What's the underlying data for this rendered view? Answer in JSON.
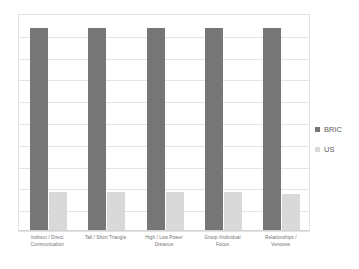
{
  "chart_data": {
    "type": "bar",
    "title": "",
    "xlabel": "",
    "ylabel": "",
    "ylim": [
      0,
      100
    ],
    "grid": true,
    "gridline_count": 10,
    "legend_position": "right",
    "categories": [
      "Indirect / Direct Communication",
      "Tall / Short Triangle",
      "High / Low Power Distance",
      "Group /Individual Focus",
      "Relationships / Ventures"
    ],
    "category_lines": [
      [
        "Indirect / Direct",
        "Communication"
      ],
      [
        "Tall / Short Triangle",
        ""
      ],
      [
        "High / Low Power",
        "Distance"
      ],
      [
        "Group /Individual",
        "Focus"
      ],
      [
        "Relationships /",
        "Ventures"
      ]
    ],
    "series": [
      {
        "name": "BRIC",
        "color": "#767676",
        "values": [
          93,
          93,
          93,
          93,
          93
        ]
      },
      {
        "name": "US",
        "color": "#d9d9d9",
        "values": [
          18,
          18,
          18,
          18,
          17
        ]
      }
    ]
  },
  "legend": {
    "items": [
      {
        "label": "BRIC",
        "color": "#767676"
      },
      {
        "label": "US",
        "color": "#d9d9d9"
      }
    ]
  },
  "colors": {
    "bric": "#767676",
    "us": "#d9d9d9",
    "gridline": "#e4e4e4",
    "plot_border": "#e2e2e2",
    "label_text": "#6f6f6f",
    "background": "#ffffff"
  }
}
